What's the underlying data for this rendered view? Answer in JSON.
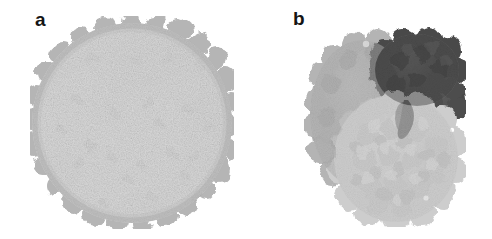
{
  "figure": {
    "background_color": "#ffffff",
    "width": 492,
    "height": 239,
    "rendering_style": "space-filling molecular surface, grayscale"
  },
  "panels": [
    {
      "id": "a",
      "label": "a",
      "label_position": {
        "x": 35,
        "y": 10
      },
      "subject": "spherical viral capsid particle",
      "shape": "sphere",
      "bounds": {
        "x": 30,
        "y": 16,
        "width": 204,
        "height": 213
      },
      "surface": {
        "base_color": "#dcdcdc",
        "highlight_color": "#ededed",
        "midtone_color": "#c6c6c6",
        "rim_color": "#a8a8a8",
        "spot_color": "#8f8f8f",
        "shadow_patch_color": "#b4b4b4",
        "texture": "granular, fine-grained stipple",
        "protrusion_count": 34
      }
    },
    {
      "id": "b",
      "label": "b",
      "label_position": {
        "x": 293,
        "y": 9
      },
      "subject": "multi-subunit macromolecular complex",
      "shape": "irregular ovoid",
      "bounds": {
        "x": 304,
        "y": 22,
        "width": 162,
        "height": 205
      },
      "subunits": [
        {
          "name": "large-subunit-left",
          "tone": "medium-gray",
          "color": "#b0b0b0",
          "position": "left"
        },
        {
          "name": "large-subunit-front",
          "tone": "light-gray",
          "color": "#cbcbcb",
          "position": "lower-center-right"
        },
        {
          "name": "small-subunit-dark",
          "tone": "dark-gray",
          "color": "#4e4e4e",
          "position": "upper-right"
        },
        {
          "name": "small-subunit-dark-lobe",
          "tone": "dark-gray",
          "color": "#555555",
          "position": "right-middle"
        }
      ],
      "surface": {
        "texture": "globular, lumpy atom-sphere packing",
        "blob_count": 260
      }
    }
  ],
  "colors": {
    "white": "#ffffff",
    "label_ink": "#141414",
    "light_gray": "#cbcbcb",
    "medium_gray": "#b0b0b0",
    "dark_gray": "#4e4e4e",
    "rim_gray": "#a8a8a8"
  }
}
